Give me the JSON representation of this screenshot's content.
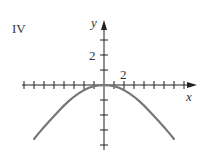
{
  "panel_label": "IV",
  "chart_data": {
    "type": "line",
    "title": "IV",
    "xlabel": "x",
    "ylabel": "y",
    "x_tick_label": "2",
    "y_tick_label": "2",
    "x_tick_step": 1,
    "y_tick_step": 1,
    "xlim": [
      -8,
      9
    ],
    "ylim": [
      -4,
      4
    ],
    "grid": false,
    "series": [
      {
        "name": "curve",
        "description": "downward parabola-like curve, vertex at origin, flattened near top",
        "x": [
          -7,
          -6,
          -5,
          -4,
          -3,
          -2,
          -1,
          0,
          1,
          2,
          3,
          4,
          5,
          6,
          7
        ],
        "y": [
          -4,
          -3.1,
          -2.3,
          -1.5,
          -0.85,
          -0.35,
          -0.05,
          0,
          -0.05,
          -0.35,
          -0.85,
          -1.5,
          -2.3,
          -3.1,
          -4
        ]
      }
    ],
    "color": "#777777"
  },
  "axes": {
    "x_label": "x",
    "y_label": "y",
    "x_tick_value": "2",
    "y_tick_value": "2"
  }
}
